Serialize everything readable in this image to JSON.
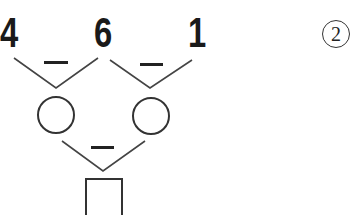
{
  "problem": {
    "number": "2",
    "top_numbers": [
      "4",
      "6",
      "1"
    ],
    "operators": {
      "top_left": "−",
      "top_right": "−",
      "bottom": "−"
    },
    "blanks": {
      "circle_left": "",
      "circle_right": "",
      "square_result": ""
    }
  },
  "colors": {
    "ink": "#1a1a1a",
    "lines": "#444444"
  }
}
